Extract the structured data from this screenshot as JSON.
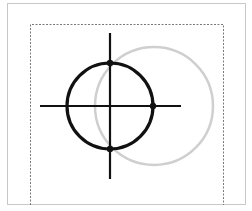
{
  "diagram": {
    "colors": {
      "background": "#ffffff",
      "frame": "#c8c8c8",
      "dashed_frame": "#7a7a7a",
      "primary_circle": "#111111",
      "secondary_circle": "#cfcfcf",
      "crosshair": "#111111",
      "handle": "#111111"
    },
    "elements": {
      "outer_frame": "outer-frame",
      "dashed_frame": "dashed-bounding-frame",
      "primary_circle": "primary-circle",
      "secondary_circle": "secondary-circle",
      "crosshair": [
        "crosshair-vertical",
        "crosshair-horizontal"
      ],
      "handles": [
        "handle-top",
        "handle-right",
        "handle-bottom"
      ]
    }
  }
}
